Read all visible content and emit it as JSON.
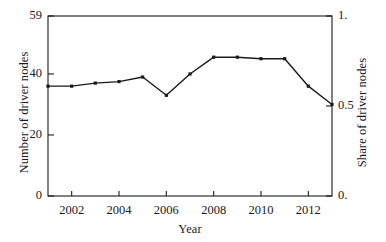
{
  "chart_data": {
    "type": "line",
    "title": "",
    "xlabel": "Year",
    "ylabel": "Number of driver nodes",
    "ylabel_right": "Share of driver nodes",
    "x": [
      2001,
      2002,
      2003,
      2004,
      2005,
      2006,
      2007,
      2008,
      2009,
      2010,
      2011,
      2012,
      2013
    ],
    "values": [
      36,
      36,
      37,
      37.5,
      39,
      33,
      40,
      45.5,
      45.5,
      45,
      45,
      36,
      30
    ],
    "share_values": [
      0.61,
      0.61,
      0.63,
      0.64,
      0.66,
      0.56,
      0.68,
      0.77,
      0.77,
      0.76,
      0.76,
      0.61,
      0.51
    ],
    "ylim": [
      0,
      59
    ],
    "ylim_right": [
      0,
      1
    ],
    "xlim": [
      2001,
      2013
    ],
    "ytick_labels": [
      "0",
      "20",
      "40",
      "59"
    ],
    "ytick_values": [
      0,
      20,
      40,
      59
    ],
    "ytick_right_labels": [
      "0.",
      "0.5",
      "1."
    ],
    "ytick_right_values": [
      0,
      0.5,
      1
    ],
    "xtick_labels": [
      "2002",
      "2004",
      "2006",
      "2008",
      "2010",
      "2012"
    ],
    "xtick_values": [
      2002,
      2004,
      2006,
      2008,
      2010,
      2012
    ],
    "grid": false,
    "legend": false,
    "marker": "square",
    "line_color": "#1a1a1a",
    "marker_color": "#1a1a1a"
  },
  "axes": {
    "left_title": "Number of driver nodes",
    "right_title": "Share of driver nodes",
    "bottom_title": "Year"
  },
  "ticks": {
    "left": [
      {
        "label": "0",
        "value": 0
      },
      {
        "label": "20",
        "value": 20
      },
      {
        "label": "40",
        "value": 40
      },
      {
        "label": "59",
        "value": 59
      }
    ],
    "right": [
      {
        "label": "0.",
        "value": 0
      },
      {
        "label": "0.5",
        "value": 0.5
      },
      {
        "label": "1.",
        "value": 1
      }
    ],
    "bottom": [
      {
        "label": "2002",
        "value": 2002
      },
      {
        "label": "2004",
        "value": 2004
      },
      {
        "label": "2006",
        "value": 2006
      },
      {
        "label": "2008",
        "value": 2008
      },
      {
        "label": "2010",
        "value": 2010
      },
      {
        "label": "2012",
        "value": 2012
      }
    ]
  }
}
